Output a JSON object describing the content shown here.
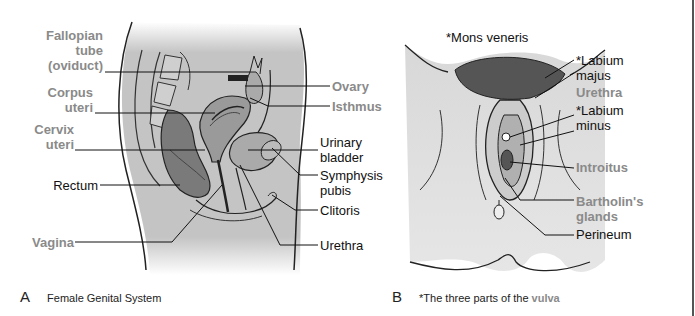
{
  "figure_a": {
    "letter": "A",
    "caption": "Female Genital System",
    "labels": {
      "fallopian_1": "Fallopian",
      "fallopian_2": "tube",
      "fallopian_3": "(oviduct)",
      "corpus_1": "Corpus",
      "corpus_2": "uteri",
      "cervix_1": "Cervix",
      "cervix_2": "uteri",
      "rectum": "Rectum",
      "vagina": "Vagina",
      "ovary": "Ovary",
      "isthmus": "Isthmus",
      "urinary_1": "Urinary",
      "urinary_2": "bladder",
      "symphysis_1": "Symphysis",
      "symphysis_2": "pubis",
      "clitoris": "Clitoris",
      "urethra": "Urethra"
    }
  },
  "figure_b": {
    "letter": "B",
    "caption_prefix": "*The three parts of the ",
    "caption_highlight": "vulva",
    "labels": {
      "mons": "*Mons veneris",
      "labium_majus_1": "*Labium",
      "labium_majus_2": "majus",
      "urethra": "Urethra",
      "labium_minus_1": "*Labium",
      "labium_minus_2": "minus",
      "introitus": "Introitus",
      "bartholin_1": "Bartholin's",
      "bartholin_2": "glands",
      "perineum": "Perineum"
    }
  },
  "colors": {
    "gray_label": "#8a8a8a",
    "black_label": "#111111",
    "tissue_fill": "#bdbdbd",
    "organ_fill": "#7a7a7a"
  }
}
